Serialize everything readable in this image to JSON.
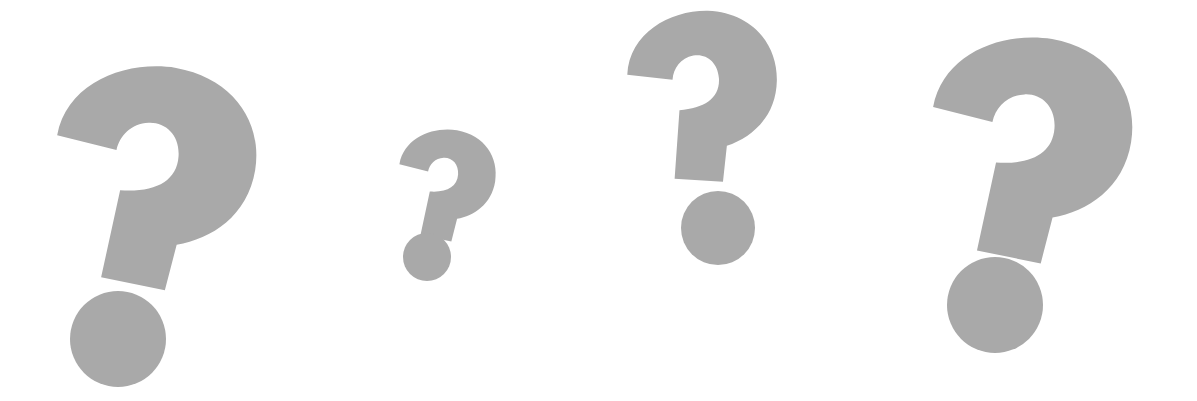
{
  "scene": {
    "background": "#ffffff",
    "fill_color": "#a9a9a9",
    "description": "Four gray question marks of varying sizes",
    "symbols": [
      {
        "glyph": "?",
        "name": "question-mark-1"
      },
      {
        "glyph": "?",
        "name": "question-mark-2"
      },
      {
        "glyph": "?",
        "name": "question-mark-3"
      },
      {
        "glyph": "?",
        "name": "question-mark-4"
      }
    ]
  }
}
